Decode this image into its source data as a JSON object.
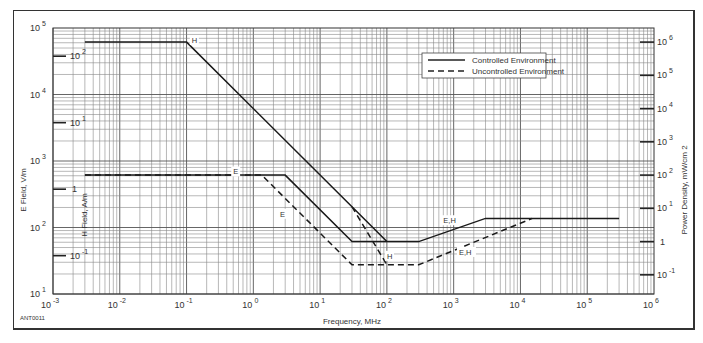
{
  "chart_data": {
    "type": "line",
    "title": "",
    "xlabel": "Frequency, MHz",
    "ylabel_left_outer": "E Field, V/m",
    "ylabel_left_inner": "H Field, A/m",
    "ylabel_right": "Power Density, mW/cm 2",
    "xscale": "log",
    "yscale": "log",
    "xlim": [
      0.001,
      1000000
    ],
    "ylim": [
      10,
      100000
    ],
    "grid": true,
    "legend_position": "upper right (inside)",
    "corner_label": "ANT0011",
    "x_ticks": [
      {
        "base": "10",
        "exp": "-3"
      },
      {
        "base": "10",
        "exp": "-2"
      },
      {
        "base": "10",
        "exp": "-1"
      },
      {
        "base": "10",
        "exp": "0"
      },
      {
        "base": "10",
        "exp": "1"
      },
      {
        "base": "10",
        "exp": "2"
      },
      {
        "base": "10",
        "exp": "3"
      },
      {
        "base": "10",
        "exp": "4"
      },
      {
        "base": "10",
        "exp": "5"
      },
      {
        "base": "10",
        "exp": "6"
      }
    ],
    "y_ticks_e_field": [
      {
        "base": "10",
        "exp": "5"
      },
      {
        "base": "10",
        "exp": "4"
      },
      {
        "base": "10",
        "exp": "3"
      },
      {
        "base": "10",
        "exp": "2"
      },
      {
        "base": "10",
        "exp": "1"
      }
    ],
    "y_ticks_h_field": [
      {
        "base": "10",
        "exp": "2"
      },
      {
        "base": "10",
        "exp": "1"
      },
      {
        "base": "1",
        "exp": ""
      },
      {
        "base": "10",
        "exp": "-1"
      }
    ],
    "y_ticks_power_density": [
      {
        "base": "10",
        "exp": "6"
      },
      {
        "base": "10",
        "exp": "5"
      },
      {
        "base": "10",
        "exp": "4"
      },
      {
        "base": "10",
        "exp": "3"
      },
      {
        "base": "10",
        "exp": "2"
      },
      {
        "base": "10",
        "exp": "1"
      },
      {
        "base": "1",
        "exp": ""
      },
      {
        "base": "10",
        "exp": "-1"
      }
    ],
    "legend": [
      {
        "name": "Controlled Environment",
        "style": "solid"
      },
      {
        "name": "Uncontrolled Environment",
        "style": "dashed"
      }
    ],
    "series": [
      {
        "name": "Controlled Environment - H",
        "style": "solid",
        "label": "H",
        "points": [
          [
            0.003,
            61400
          ],
          [
            0.1,
            61400
          ],
          [
            100,
            61.4
          ],
          [
            300,
            61.4
          ],
          [
            3000,
            137
          ],
          [
            300000,
            137
          ]
        ]
      },
      {
        "name": "Controlled Environment - E",
        "style": "solid",
        "label": "E",
        "points": [
          [
            0.003,
            614
          ],
          [
            3,
            614
          ],
          [
            30,
            61.4
          ],
          [
            100,
            61.4
          ]
        ]
      },
      {
        "name": "Uncontrolled Environment - E",
        "style": "dashed",
        "label": "E",
        "points": [
          [
            0.003,
            614
          ],
          [
            1.34,
            614
          ],
          [
            30,
            27.5
          ],
          [
            300,
            27.5
          ],
          [
            15000,
            137
          ]
        ]
      },
      {
        "name": "Uncontrolled Environment - H",
        "style": "dashed",
        "label": "H",
        "points": [
          [
            30,
            205
          ],
          [
            100,
            27.5
          ]
        ]
      }
    ],
    "annotations": [
      {
        "text": "H",
        "near": [
          0.12,
          61400
        ]
      },
      {
        "text": "E",
        "near": [
          0.5,
          650
        ]
      },
      {
        "text": "E",
        "near": [
          2.5,
          150
        ]
      },
      {
        "text": "H",
        "near": [
          100,
          35
        ]
      },
      {
        "text": "E,H",
        "near": [
          700,
          120
        ]
      },
      {
        "text": "E,H",
        "near": [
          1200,
          40
        ]
      }
    ]
  }
}
